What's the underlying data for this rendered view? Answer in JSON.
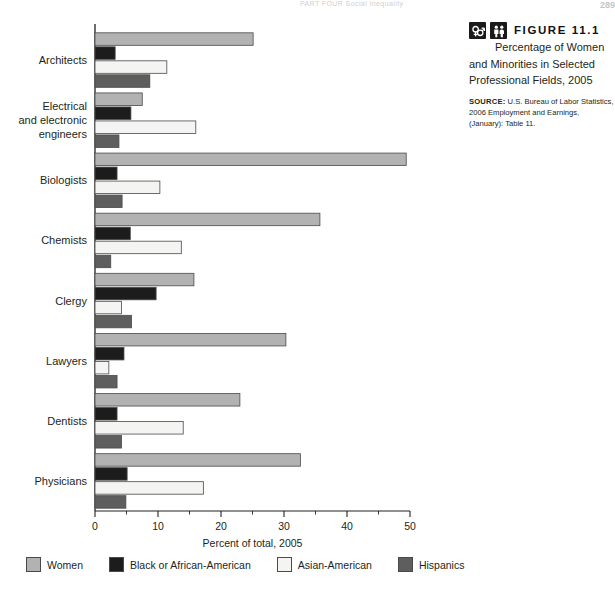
{
  "running_head": {
    "text": "PART FOUR  Social Inequality",
    "page_number": "289"
  },
  "caption": {
    "icons": [
      "gender-symbols-icon",
      "people-icon"
    ],
    "figure_label": "FIGURE 11.1",
    "title_lead": "Percentage of",
    "title_rest": "Women and Minorities in Selected Professional Fields, 2005",
    "source_label": "SOURCE:",
    "source_text": "U.S. Bureau of Labor Statistics, 2006 Employment and Earnings, (January): Table 11."
  },
  "legend": [
    {
      "label": "Women",
      "color": "#b2b2b2"
    },
    {
      "label": "Black or African-American",
      "color": "#1c1c1c"
    },
    {
      "label": "Asian-American",
      "color": "#f4f4f2"
    },
    {
      "label": "Hispanics",
      "color": "#5e5e5e"
    }
  ],
  "chart_data": {
    "type": "bar",
    "orientation": "horizontal",
    "title": "Percentage of Women and Minorities in Selected Professional Fields, 2005",
    "xlabel": "Percent of total, 2005",
    "ylabel": "",
    "xlim": [
      0,
      50
    ],
    "xticks": [
      0,
      10,
      20,
      30,
      40,
      50
    ],
    "minor_xticks": [
      5,
      15,
      25,
      35,
      45
    ],
    "grid": false,
    "legend_position": "bottom",
    "categories": [
      "Architects",
      "Electrical and electronic engineers",
      "Biologists",
      "Chemists",
      "Clergy",
      "Lawyers",
      "Dentists",
      "Physicians"
    ],
    "category_label_lines": [
      [
        "Architects"
      ],
      [
        "Electrical",
        "and electronic",
        "engineers"
      ],
      [
        "Biologists"
      ],
      [
        "Chemists"
      ],
      [
        "Clergy"
      ],
      [
        "Lawyers"
      ],
      [
        "Dentists"
      ],
      [
        "Physicians"
      ]
    ],
    "series": [
      {
        "name": "Women",
        "color": "#b2b2b2",
        "values": [
          25.1,
          7.5,
          49.4,
          35.7,
          15.7,
          30.3,
          23.0,
          32.6
        ]
      },
      {
        "name": "Black or African-American",
        "color": "#1c1c1c",
        "values": [
          3.2,
          5.7,
          3.5,
          5.6,
          9.7,
          4.6,
          3.5,
          5.1
        ]
      },
      {
        "name": "Asian-American",
        "color": "#f4f4f2",
        "values": [
          11.4,
          16.0,
          10.3,
          13.7,
          4.2,
          2.2,
          14.0,
          17.2
        ]
      },
      {
        "name": "Hispanics",
        "color": "#5e5e5e",
        "values": [
          8.7,
          3.8,
          4.3,
          2.5,
          5.8,
          3.5,
          4.2,
          4.9
        ]
      }
    ]
  }
}
